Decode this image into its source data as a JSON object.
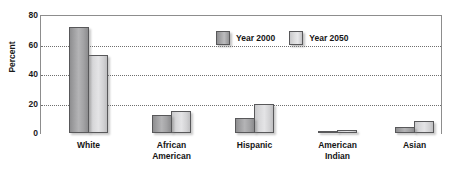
{
  "chart_data": {
    "type": "bar",
    "title": "",
    "xlabel": "",
    "ylabel": "Percent",
    "ylim": [
      0,
      80
    ],
    "yticks": [
      0,
      20,
      40,
      60,
      80
    ],
    "grid": "horizontal-dotted",
    "legend_position": "top-center-right",
    "categories": [
      "White",
      "African American",
      "Hispanic",
      "American Indian",
      "Asian"
    ],
    "category_lines": [
      [
        "White"
      ],
      [
        "African",
        "American"
      ],
      [
        "Hispanic"
      ],
      [
        "American",
        "Indian"
      ],
      [
        "Asian"
      ]
    ],
    "series": [
      {
        "name": "Year 2000",
        "color": "#a0a0a2",
        "values": [
          72,
          12,
          10,
          1,
          4
        ]
      },
      {
        "name": "Year 2050",
        "color": "#d8d8da",
        "values": [
          53,
          15,
          20,
          2,
          8
        ]
      }
    ]
  },
  "axis": {
    "y_title": "Percent",
    "y_tick_labels": [
      "0",
      "20",
      "40",
      "60",
      "80"
    ]
  },
  "legend": {
    "entries": [
      {
        "label": "Year 2000",
        "swatch": "legend-swatch-year-2000"
      },
      {
        "label": "Year 2050",
        "swatch": "legend-swatch-year-2050"
      }
    ]
  }
}
